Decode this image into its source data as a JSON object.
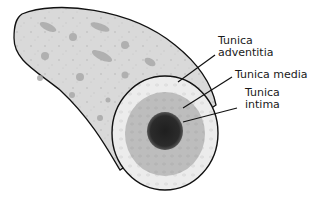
{
  "diagram": {
    "colors": {
      "background": "#ffffff",
      "outline": "#111111",
      "vessel_body": "#d8d8d8",
      "adventitia": "#ececec",
      "media": "#bdbdbd",
      "intima": "#2b2b2b",
      "speckle": "#a9a9a9"
    },
    "labels": [
      {
        "id": "adventitia",
        "line1": "Tunica",
        "line2": "adventitia"
      },
      {
        "id": "media",
        "line1": "Tunica media",
        "line2": ""
      },
      {
        "id": "intima",
        "line1": "Tunica",
        "line2": "intima"
      }
    ]
  }
}
